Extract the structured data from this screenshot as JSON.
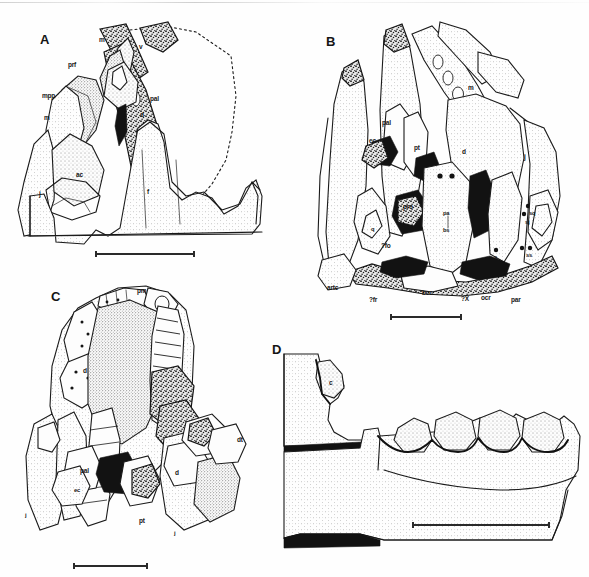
{
  "figure": {
    "type": "scientific-line-drawing-plate",
    "background_color": "#fefefe",
    "ink_color": "#191919",
    "panel_count": 4
  },
  "panels": [
    {
      "id": "A",
      "letter": "A",
      "letter_pos": {
        "x": 40,
        "y": 33
      },
      "view": "lateral-oblique",
      "labels": [
        {
          "text": "m",
          "x": 99,
          "y": 37,
          "size": "sm"
        },
        {
          "text": "v",
          "x": 139,
          "y": 44,
          "size": "sm"
        },
        {
          "text": "prf",
          "x": 68,
          "y": 62,
          "size": "sm"
        },
        {
          "text": "mpp",
          "x": 42,
          "y": 93,
          "size": "sm"
        },
        {
          "text": "pal",
          "x": 150,
          "y": 96,
          "size": "sm"
        },
        {
          "text": "d",
          "x": 140,
          "y": 112,
          "size": "sm"
        },
        {
          "text": "m",
          "x": 44,
          "y": 115,
          "size": "sm"
        },
        {
          "text": "j",
          "x": 39,
          "y": 191,
          "size": "sm"
        },
        {
          "text": "ac",
          "x": 76,
          "y": 172,
          "size": "sm"
        },
        {
          "text": "f",
          "x": 147,
          "y": 189,
          "size": "sm"
        }
      ],
      "scalebar": {
        "x": 95,
        "y": 253,
        "width": 100
      }
    },
    {
      "id": "B",
      "letter": "B",
      "letter_pos": {
        "x": 326,
        "y": 35
      },
      "view": "palatal-occipital",
      "labels": [
        {
          "text": "m",
          "x": 468,
          "y": 85,
          "size": "sm"
        },
        {
          "text": "pal",
          "x": 382,
          "y": 120,
          "size": "sm"
        },
        {
          "text": "ec",
          "x": 369,
          "y": 138,
          "size": "sm"
        },
        {
          "text": "pt",
          "x": 414,
          "y": 145,
          "size": "sm"
        },
        {
          "text": "d",
          "x": 462,
          "y": 149,
          "size": "sm"
        },
        {
          "text": "j",
          "x": 524,
          "y": 154,
          "size": "sm"
        },
        {
          "text": "pro",
          "x": 403,
          "y": 204,
          "size": "sm"
        },
        {
          "text": "pa",
          "x": 443,
          "y": 211,
          "size": "tiny"
        },
        {
          "text": "bs",
          "x": 443,
          "y": 228,
          "size": "tiny"
        },
        {
          "text": "sq",
          "x": 529,
          "y": 211,
          "size": "tiny"
        },
        {
          "text": "sj",
          "x": 525,
          "y": 220,
          "size": "tiny"
        },
        {
          "text": "ss",
          "x": 526,
          "y": 253,
          "size": "tiny"
        },
        {
          "text": "s",
          "x": 494,
          "y": 255,
          "size": "tiny"
        },
        {
          "text": "q",
          "x": 371,
          "y": 227,
          "size": "tiny"
        },
        {
          "text": "?fo",
          "x": 381,
          "y": 243,
          "size": "sm"
        },
        {
          "text": "artc",
          "x": 327,
          "y": 285,
          "size": "sm"
        },
        {
          "text": "?fr",
          "x": 369,
          "y": 297,
          "size": "sm"
        },
        {
          "text": "bcc",
          "x": 422,
          "y": 290,
          "size": "sm"
        },
        {
          "text": "?X",
          "x": 461,
          "y": 296,
          "size": "sm"
        },
        {
          "text": "ocr",
          "x": 481,
          "y": 295,
          "size": "sm"
        },
        {
          "text": "par",
          "x": 511,
          "y": 297,
          "size": "sm"
        }
      ],
      "scalebar": {
        "x": 390,
        "y": 316,
        "width": 72
      }
    },
    {
      "id": "C",
      "letter": "C",
      "letter_pos": {
        "x": 51,
        "y": 290
      },
      "view": "dorsal-oblique",
      "labels": [
        {
          "text": "pm",
          "x": 137,
          "y": 288,
          "size": "sm"
        },
        {
          "text": "d",
          "x": 83,
          "y": 368,
          "size": "sm"
        },
        {
          "text": "pal",
          "x": 80,
          "y": 468,
          "size": "sm"
        },
        {
          "text": "ec",
          "x": 74,
          "y": 488,
          "size": "tiny"
        },
        {
          "text": "pt",
          "x": 139,
          "y": 518,
          "size": "sm"
        },
        {
          "text": "d",
          "x": 175,
          "y": 470,
          "size": "sm"
        },
        {
          "text": "dt",
          "x": 237,
          "y": 437,
          "size": "sm"
        },
        {
          "text": "j",
          "x": 25,
          "y": 513,
          "size": "tiny"
        },
        {
          "text": "j",
          "x": 174,
          "y": 531,
          "size": "tiny"
        }
      ],
      "scalebar": {
        "x": 73,
        "y": 565,
        "width": 75
      }
    },
    {
      "id": "D",
      "letter": "D",
      "letter_pos": {
        "x": 272,
        "y": 343
      },
      "view": "lateral-dentition",
      "labels": [
        {
          "text": "c",
          "x": 329,
          "y": 380,
          "size": "sm"
        }
      ],
      "scalebar": {
        "x": 412,
        "y": 524,
        "width": 138
      }
    }
  ],
  "abbreviation_key": {
    "m": "maxilla",
    "v": "vomer",
    "prf": "prefrontal",
    "mpp": "median palatal process",
    "pal": "palatine",
    "d": "dentary",
    "j": "jugal",
    "ac": "alveolar canal",
    "f": "frontal",
    "ec": "ectopterygoid",
    "pt": "pterygoid",
    "pro": "prootic",
    "pa": "parietal",
    "bs": "basisphenoid",
    "sq": "squamosal",
    "sj": "surangular-jugal contact",
    "ss": "supraoccipital suture",
    "s": "stapes",
    "q": "quadrate",
    "?fo": "fenestra ovalis",
    "artc": "articular condyle",
    "?fr": "foramen rotundum",
    "bcc": "braincase cavity",
    "?X": "vagus foramen",
    "ocr": "occipital crest",
    "par": "paroccipital process",
    "pm": "premaxilla",
    "dt": "dentary teeth",
    "c": "canine"
  }
}
